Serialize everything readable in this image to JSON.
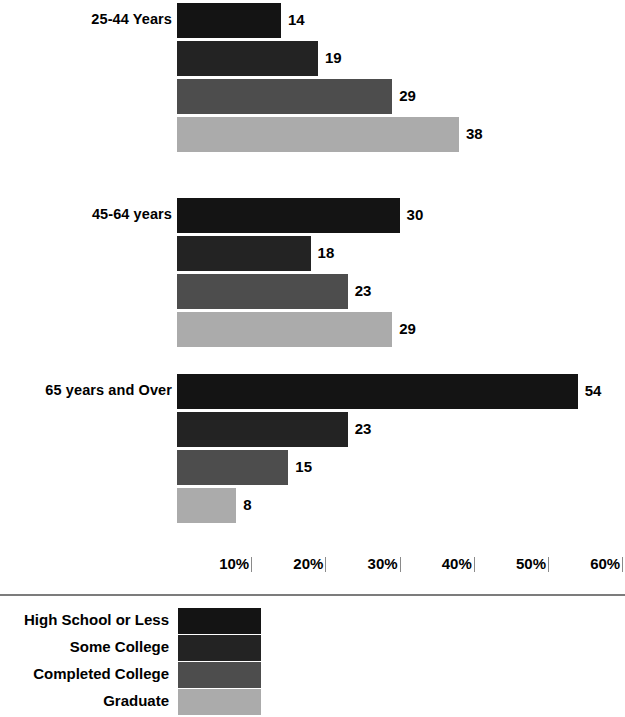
{
  "chart_data": {
    "type": "bar",
    "orientation": "horizontal",
    "title": "",
    "subtitle": "",
    "xlabel": "",
    "ylabel": "",
    "xlim": [
      0,
      63
    ],
    "grid": false,
    "legend_position": "bottom-left",
    "categories": [
      "25-44 Years",
      "45-64 years",
      "65 years and Over"
    ],
    "series": [
      {
        "name": "High School or Less",
        "color": "#141414",
        "values": [
          14,
          30,
          54
        ]
      },
      {
        "name": "Some College",
        "color": "#232323",
        "values": [
          19,
          18,
          23
        ]
      },
      {
        "name": "Completed College",
        "color": "#4d4d4d",
        "values": [
          29,
          23,
          15
        ]
      },
      {
        "name": "Graduate",
        "color": "#ababab",
        "values": [
          38,
          29,
          8
        ]
      }
    ],
    "xticks": [
      {
        "label": "10%",
        "value": 10
      },
      {
        "label": "20%",
        "value": 20
      },
      {
        "label": "30%",
        "value": 30
      },
      {
        "label": "40%",
        "value": 40
      },
      {
        "label": "50%",
        "value": 50
      },
      {
        "label": "60%",
        "value": 60
      }
    ],
    "value_labels": [
      [
        "14",
        "19",
        "29",
        "38"
      ],
      [
        "30",
        "18",
        "23",
        "29"
      ],
      [
        "54",
        "23",
        "15",
        "8"
      ]
    ]
  },
  "groups": [
    {
      "label": "25-44 Years",
      "bars": [
        {
          "series": "High School or Less",
          "value": 14,
          "label": "14",
          "color": "#141414"
        },
        {
          "series": "Some College",
          "value": 19,
          "label": "19",
          "color": "#232323"
        },
        {
          "series": "Completed College",
          "value": 29,
          "label": "29",
          "color": "#4d4d4d"
        },
        {
          "series": "Graduate",
          "value": 38,
          "label": "38",
          "color": "#ababab"
        }
      ]
    },
    {
      "label": "45-64 years",
      "bars": [
        {
          "series": "High School or Less",
          "value": 30,
          "label": "30",
          "color": "#141414"
        },
        {
          "series": "Some College",
          "value": 18,
          "label": "18",
          "color": "#232323"
        },
        {
          "series": "Completed College",
          "value": 23,
          "label": "23",
          "color": "#4d4d4d"
        },
        {
          "series": "Graduate",
          "value": 29,
          "label": "29",
          "color": "#ababab"
        }
      ]
    },
    {
      "label": "65 years and Over",
      "bars": [
        {
          "series": "High School or Less",
          "value": 54,
          "label": "54",
          "color": "#141414"
        },
        {
          "series": "Some College",
          "value": 23,
          "label": "23",
          "color": "#232323"
        },
        {
          "series": "Completed College",
          "value": 15,
          "label": "15",
          "color": "#4d4d4d"
        },
        {
          "series": "Graduate",
          "value": 8,
          "label": "8",
          "color": "#ababab"
        }
      ]
    }
  ],
  "axis": {
    "ticks": [
      {
        "label": "10%",
        "value": 10
      },
      {
        "label": "20%",
        "value": 20
      },
      {
        "label": "30%",
        "value": 30
      },
      {
        "label": "40%",
        "value": 40
      },
      {
        "label": "50%",
        "value": 50
      },
      {
        "label": "60%",
        "value": 60
      }
    ]
  },
  "legend": {
    "items": [
      {
        "label": "High School or Less",
        "color": "#141414"
      },
      {
        "label": "Some College",
        "color": "#232323"
      },
      {
        "label": "Completed College",
        "color": "#4d4d4d"
      },
      {
        "label": "Graduate",
        "color": "#ababab"
      }
    ]
  },
  "layout": {
    "bar_origin_x": 177,
    "px_per_unit": 7.42,
    "bar_height": 35,
    "bar_gap": 3,
    "group_tops": [
      3,
      198,
      374
    ],
    "axis_top": 556,
    "rule_top": 594,
    "legend_top": 608
  }
}
